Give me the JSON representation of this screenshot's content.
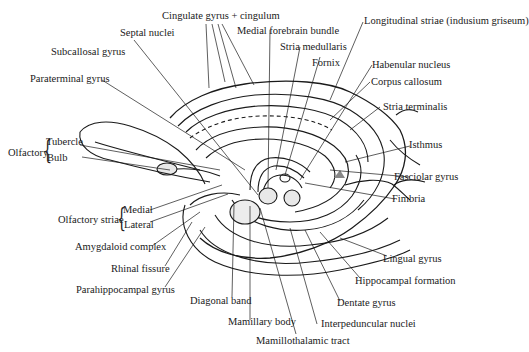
{
  "diagram": {
    "labels": {
      "cingulate": "Cingulate gyrus + cingulum",
      "septal": "Septal nuclei",
      "medial_forebrain": "Medial forebrain bundle",
      "longitudinal": "Longitudinal striae (indusium griseum)",
      "subcallosal": "Subcallosal gyrus",
      "stria_medullaris": "Stria medullaris",
      "fornix": "Fornix",
      "paraterminal": "Paraterminal gyrus",
      "habenular": "Habenular nucleus",
      "corpus_callosum": "Corpus callosum",
      "stria_terminalis": "Stria terminalis",
      "olfactory": "Olfactory",
      "tubercle": "Tubercle",
      "bulb": "Bulb",
      "isthmus": "Isthmus",
      "fasciolar": "Fasciolar gyrus",
      "fimbria": "Fimbria",
      "olfactory_striae": "Olfactory striae",
      "medial": "Medial",
      "lateral": "Lateral",
      "amygdaloid": "Amygdaloid complex",
      "rhinal": "Rhinal fissure",
      "parahippocampal": "Parahippocampal gyrus",
      "lingual": "Lingual gyrus",
      "hippocampal": "Hippocampal formation",
      "dentate": "Dentate gyrus",
      "diagonal": "Diagonal band",
      "interpeduncular": "Interpeduncular nuclei",
      "mamillary": "Mamillary body",
      "mamillothalamic": "Mamillothalamic tract"
    }
  }
}
